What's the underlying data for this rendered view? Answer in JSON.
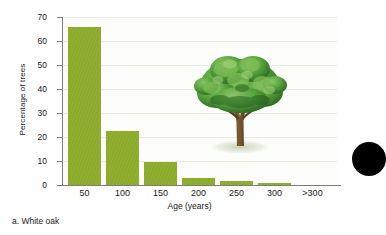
{
  "figure": {
    "caption": "a. White oak",
    "tree_icon": "oak-tree-photo",
    "edge_artifact": "black-circle-bullet"
  },
  "colors": {
    "bar": "#8cab2a",
    "axis": "#7c7c7c",
    "gridline": "#eceae2",
    "text": "#1a1a1a",
    "plot_background": "#fdfdfb",
    "tree_canopy": "#4e9c36",
    "tree_trunk": "#6b4a2b"
  },
  "chart_data": {
    "type": "bar",
    "title": "",
    "xlabel": "Age (years)",
    "ylabel": "Percentage of trees",
    "categories": [
      "50",
      "100",
      "150",
      "200",
      "250",
      "300",
      ">300"
    ],
    "values": [
      66,
      22.5,
      9.5,
      3,
      1.5,
      0.7,
      0
    ],
    "ylim": [
      0,
      70
    ],
    "yticks": [
      0,
      10,
      20,
      30,
      40,
      50,
      60,
      70
    ],
    "ytick_labels": [
      "0",
      "10",
      "20",
      "30",
      "40",
      "50",
      "60",
      "70"
    ],
    "grid": true,
    "legend": "none",
    "series_name": "White oak"
  }
}
